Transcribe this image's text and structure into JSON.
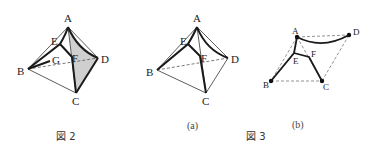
{
  "figure2": {
    "caption": "図 2",
    "labels": {
      "A": "A",
      "B": "B",
      "C": "C",
      "D": "D",
      "E": "E",
      "F": "F",
      "G": "G"
    }
  },
  "figure3": {
    "caption": "図 3",
    "panel_a": {
      "sublabel": "(a)",
      "labels": {
        "A": "A",
        "B": "B",
        "C": "C",
        "D": "D",
        "E": "E",
        "F": "F"
      }
    },
    "panel_b": {
      "sublabel": "(b)",
      "labels": {
        "A": "A",
        "B": "B",
        "C": "C",
        "D": "D",
        "E": "E",
        "F": "F"
      }
    }
  },
  "colors": {
    "line": "#1a1a1a",
    "thin_line": "#333333",
    "shade": "#cfcfcf",
    "dashed": "#777777"
  }
}
